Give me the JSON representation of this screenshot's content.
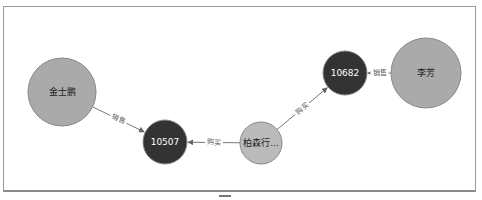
{
  "graph": {
    "nodes": [
      {
        "id": "jin",
        "label": "金士鹏",
        "cx": 62,
        "cy": 92,
        "r": 34,
        "fill": "#aaaaaa",
        "text_color": "#222222"
      },
      {
        "id": "o10507",
        "label": "10507",
        "cx": 165,
        "cy": 142,
        "r": 22,
        "fill": "#333333",
        "text_color": "#ffffff"
      },
      {
        "id": "bai",
        "label": "柏森行...",
        "cx": 261,
        "cy": 143,
        "r": 21,
        "fill": "#bbbbbb",
        "text_color": "#222222"
      },
      {
        "id": "o10682",
        "label": "10682",
        "cx": 345,
        "cy": 73,
        "r": 22,
        "fill": "#333333",
        "text_color": "#ffffff"
      },
      {
        "id": "li",
        "label": "李芳",
        "cx": 426,
        "cy": 73,
        "r": 35,
        "fill": "#aaaaaa",
        "text_color": "#222222"
      }
    ],
    "edges": [
      {
        "from": "jin",
        "to": "o10507",
        "label": "销售"
      },
      {
        "from": "bai",
        "to": "o10507",
        "label": "购买"
      },
      {
        "from": "bai",
        "to": "o10682",
        "label": "购买"
      },
      {
        "from": "li",
        "to": "o10682",
        "label": "销售"
      }
    ],
    "colors": {
      "edge": "#777777",
      "node_stroke": "#888888",
      "frame_border": "#9a9a9a"
    }
  }
}
